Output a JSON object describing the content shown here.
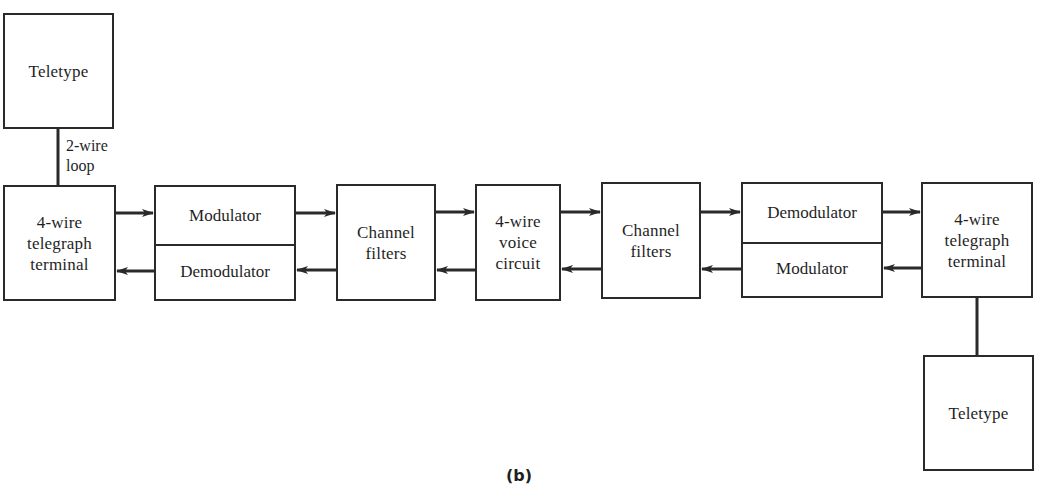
{
  "figure": {
    "caption": "(b)",
    "colors": {
      "line": "#2a2a2a",
      "background": "#ffffff",
      "text": "#1f1f1f"
    }
  },
  "blocks": {
    "teletype_left": "Teletype",
    "loop_label": "2-wire\nloop",
    "terminal_left": "4-wire\ntelegraph\nterminal",
    "modem_left": {
      "top": "Modulator",
      "bottom": "Demodulator"
    },
    "filters_left": "Channel\nfilters",
    "voice_circuit": "4-wire\nvoice\ncircuit",
    "filters_right": "Channel\nfilters",
    "modem_right": {
      "top": "Demodulator",
      "bottom": "Modulator"
    },
    "terminal_right": "4-wire\ntelegraph\nterminal",
    "teletype_right": "Teletype"
  },
  "connections": [
    {
      "from": "teletype_left",
      "to": "terminal_left",
      "type": "line"
    },
    {
      "from": "terminal_left",
      "to": "modem_left.top",
      "type": "arrow"
    },
    {
      "from": "modem_left.top",
      "to": "filters_left",
      "type": "arrow"
    },
    {
      "from": "filters_left",
      "to": "voice_circuit",
      "type": "arrow"
    },
    {
      "from": "voice_circuit",
      "to": "filters_right",
      "type": "arrow"
    },
    {
      "from": "filters_right",
      "to": "modem_right.top",
      "type": "arrow"
    },
    {
      "from": "modem_right.top",
      "to": "terminal_right",
      "type": "arrow"
    },
    {
      "from": "terminal_right",
      "to": "modem_right.bottom",
      "type": "arrow"
    },
    {
      "from": "modem_right.bottom",
      "to": "filters_right",
      "type": "arrow"
    },
    {
      "from": "filters_right",
      "to": "voice_circuit",
      "type": "arrow"
    },
    {
      "from": "voice_circuit",
      "to": "filters_left",
      "type": "arrow"
    },
    {
      "from": "filters_left",
      "to": "modem_left.bottom",
      "type": "arrow"
    },
    {
      "from": "modem_left.bottom",
      "to": "terminal_left",
      "type": "arrow"
    },
    {
      "from": "terminal_right",
      "to": "teletype_right",
      "type": "line"
    }
  ]
}
